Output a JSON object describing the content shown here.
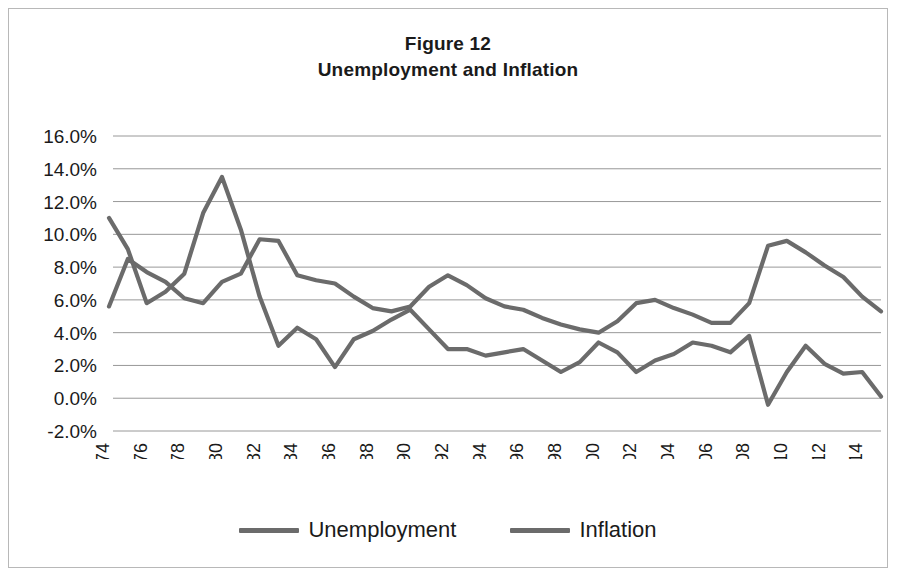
{
  "figure": {
    "title_line1": "Figure 12",
    "title_line2": "Unemployment and Inflation"
  },
  "legend": {
    "position": "bottom-center",
    "items": [
      {
        "label": "Unemployment",
        "color": "#6b6b6b"
      },
      {
        "label": "Inflation",
        "color": "#6b6b6b"
      }
    ]
  },
  "chart_data": {
    "type": "line",
    "xlabel": "",
    "ylabel": "",
    "ylim": [
      -2.0,
      16.0
    ],
    "ytick_step": 2.0,
    "ytick_labels": [
      "16.0%",
      "14.0%",
      "12.0%",
      "10.0%",
      "8.0%",
      "6.0%",
      "4.0%",
      "2.0%",
      "0.0%",
      "-2.0%"
    ],
    "ytick_values": [
      16.0,
      14.0,
      12.0,
      10.0,
      8.0,
      6.0,
      4.0,
      2.0,
      0.0,
      -2.0
    ],
    "grid": true,
    "grid_axis": "y",
    "xtick_labels": [
      "1974",
      "1976",
      "1978",
      "1980",
      "1982",
      "1984",
      "1986",
      "1988",
      "1990",
      "1992",
      "1994",
      "1996",
      "1998",
      "2000",
      "2002",
      "2004",
      "2006",
      "2008",
      "2010",
      "2012",
      "2014"
    ],
    "xtick_rotation": 90,
    "x": [
      1974,
      1975,
      1976,
      1977,
      1978,
      1979,
      1980,
      1981,
      1982,
      1983,
      1984,
      1985,
      1986,
      1987,
      1988,
      1989,
      1990,
      1991,
      1992,
      1993,
      1994,
      1995,
      1996,
      1997,
      1998,
      1999,
      2000,
      2001,
      2002,
      2003,
      2004,
      2005,
      2006,
      2007,
      2008,
      2009,
      2010,
      2011,
      2012,
      2013,
      2014,
      2015
    ],
    "series": [
      {
        "name": "Unemployment",
        "color": "#6b6b6b",
        "values": [
          5.6,
          8.5,
          7.7,
          7.1,
          6.1,
          5.8,
          7.1,
          7.6,
          9.7,
          9.6,
          7.5,
          7.2,
          7.0,
          6.2,
          5.5,
          5.3,
          5.6,
          6.8,
          7.5,
          6.9,
          6.1,
          5.6,
          5.4,
          4.9,
          4.5,
          4.2,
          4.0,
          4.7,
          5.8,
          6.0,
          5.5,
          5.1,
          4.6,
          4.6,
          5.8,
          9.3,
          9.6,
          8.9,
          8.1,
          7.4,
          6.2,
          5.3
        ]
      },
      {
        "name": "Inflation",
        "color": "#6b6b6b",
        "values": [
          11.0,
          9.1,
          5.8,
          6.5,
          7.6,
          11.3,
          13.5,
          10.3,
          6.2,
          3.2,
          4.3,
          3.6,
          1.9,
          3.6,
          4.1,
          4.8,
          5.4,
          4.2,
          3.0,
          3.0,
          2.6,
          2.8,
          3.0,
          2.3,
          1.6,
          2.2,
          3.4,
          2.8,
          1.6,
          2.3,
          2.7,
          3.4,
          3.2,
          2.8,
          3.8,
          -0.4,
          1.6,
          3.2,
          2.1,
          1.5,
          1.6,
          0.1
        ]
      }
    ]
  }
}
